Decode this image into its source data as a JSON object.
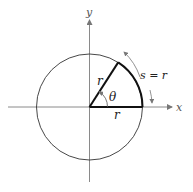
{
  "diagram": {
    "axes": {
      "x_label": "x",
      "y_label": "y",
      "color": "#8a8a8a"
    },
    "circle": {
      "cx": 89.5,
      "cy": 107,
      "r": 53,
      "color": "#333333"
    },
    "angle": {
      "label": "θ",
      "theta_deg": 57.3
    },
    "radius_labels": {
      "terminal": "r",
      "initial": "r"
    },
    "arc_label": "s = r",
    "colors": {
      "bold": "#111111",
      "axis": "#8a8a8a",
      "arrow": "#777777"
    }
  }
}
